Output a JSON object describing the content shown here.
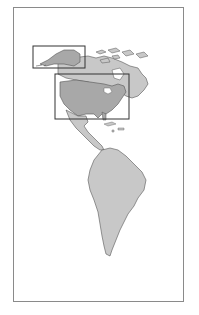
{
  "map": {
    "title": "",
    "region": "Americas",
    "colors": {
      "background": "#ffffff",
      "frame": "#8a8a8a",
      "land_light": "#c8c8c8",
      "land_dark": "#a8a8a8",
      "coastline": "#555555",
      "highlight_box": "#333333"
    },
    "highlight_boxes": [
      {
        "name": "alaska-box",
        "x": 33,
        "y": 46,
        "width": 52,
        "height": 22
      },
      {
        "name": "contiguous-us-box",
        "x": 55,
        "y": 74,
        "width": 74,
        "height": 45
      }
    ],
    "regions": [
      "north-america",
      "alaska",
      "canada",
      "contiguous-us",
      "greenland",
      "central-america",
      "caribbean",
      "south-america"
    ]
  }
}
